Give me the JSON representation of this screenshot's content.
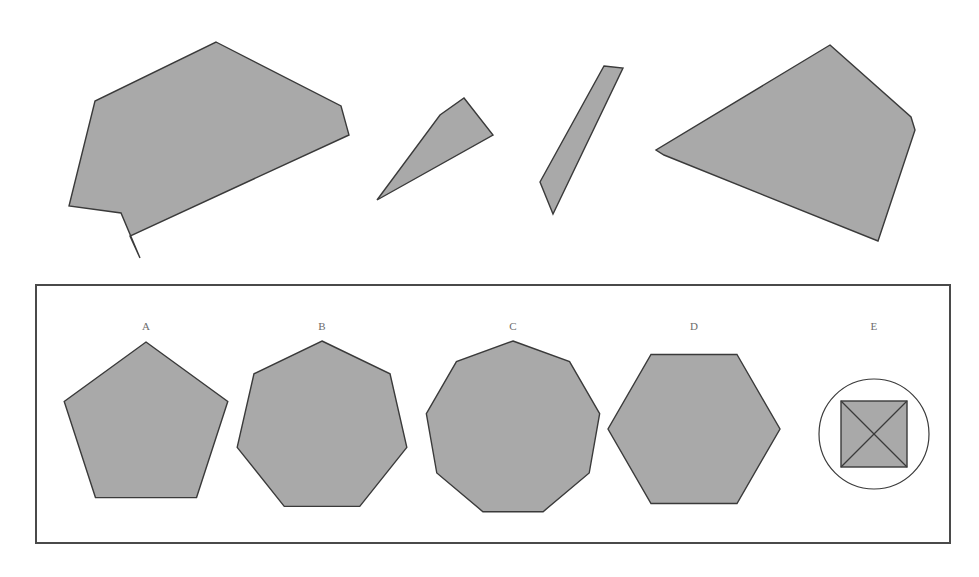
{
  "document": {
    "type": "spatial-reasoning-puzzle",
    "background_color": "#ffffff",
    "width": 979,
    "height": 577
  },
  "style": {
    "piece_fill": "#a9a9a9",
    "piece_stroke": "#3a3a3a",
    "panel_border_color": "#4a4a4a",
    "label_color": "#6c6c6c"
  },
  "prompt_pieces": {
    "name": "puzzle-pieces-row",
    "count": 4,
    "pieces": [
      {
        "id": "piece-1",
        "name": "piece-large-notched-polygon",
        "sides": 7,
        "description": "large irregular polygon with a downward spike notch at lower left",
        "points": "216 42, 341 106, 349 135, 130 236, 140 258, 121 213, 69 206, 95 101"
      },
      {
        "id": "piece-2",
        "name": "piece-parallelogram-wide",
        "sides": 4,
        "description": "slanted parallelogram leaning right",
        "points": "464 98, 493 135, 377 200, 440 115"
      },
      {
        "id": "piece-3",
        "name": "piece-parallelogram-narrow",
        "sides": 4,
        "description": "narrow slanted sliver parallelogram",
        "points": "604 66, 623 68, 553 214, 540 182"
      },
      {
        "id": "piece-4",
        "name": "piece-large-kite-polygon",
        "sides": 6,
        "description": "large kite-like polygon, wide at right",
        "points": "830 45, 911 117, 915 130, 878 241, 664 155, 656 150"
      }
    ]
  },
  "answer_panel": {
    "name": "answer-options-panel",
    "border": {
      "x": 36,
      "y": 285,
      "width": 914,
      "height": 258,
      "stroke_width": 2
    },
    "options": [
      {
        "key": "A",
        "label": "A",
        "name": "option-a",
        "shape": "pentagon",
        "sides": 5,
        "center_x": 146,
        "center_y": 428,
        "radius": 86,
        "label_x": 146,
        "label_y": 330
      },
      {
        "key": "B",
        "label": "B",
        "name": "option-b",
        "shape": "heptagon",
        "sides": 7,
        "center_x": 322,
        "center_y": 428,
        "radius": 87,
        "label_x": 322,
        "label_y": 330
      },
      {
        "key": "C",
        "label": "C",
        "name": "option-c",
        "shape": "nonagon",
        "sides": 9,
        "center_x": 513,
        "center_y": 429,
        "radius": 88,
        "label_x": 513,
        "label_y": 330
      },
      {
        "key": "D",
        "label": "D",
        "name": "option-d",
        "shape": "hexagon",
        "sides": 6,
        "center_x": 694,
        "center_y": 429,
        "radius": 86,
        "label_x": 694,
        "label_y": 330
      },
      {
        "key": "E",
        "label": "E",
        "name": "option-e",
        "shape": "circle-with-crossed-square",
        "sides": 0,
        "center_x": 874,
        "center_y": 434,
        "radius": 55,
        "square_half": 33,
        "label_x": 874,
        "label_y": 330
      }
    ]
  }
}
